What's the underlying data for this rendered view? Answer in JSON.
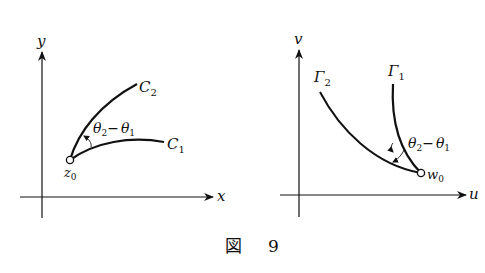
{
  "figure": {
    "caption": {
      "kanji": "図",
      "number": "9"
    },
    "left_panel": {
      "x_axis_label": "x",
      "y_axis_label": "y",
      "point_label": "z",
      "point_sub": "0",
      "curve1": {
        "label": "C",
        "sub": "1"
      },
      "curve2": {
        "label": "C",
        "sub": "2"
      },
      "angle_label": {
        "a": "θ",
        "a_sub": "2",
        "minus": "−",
        "b": "θ",
        "b_sub": "1"
      }
    },
    "right_panel": {
      "x_axis_label": "u",
      "y_axis_label": "v",
      "point_label": "w",
      "point_sub": "0",
      "curve1": {
        "label": "Γ",
        "sub": "1"
      },
      "curve2": {
        "label": "Γ",
        "sub": "2"
      },
      "angle_label": {
        "a": "θ",
        "a_sub": "2",
        "minus": "−",
        "b": "θ",
        "b_sub": "1"
      }
    },
    "colors": {
      "ink": "#111111",
      "background": "#ffffff"
    }
  }
}
